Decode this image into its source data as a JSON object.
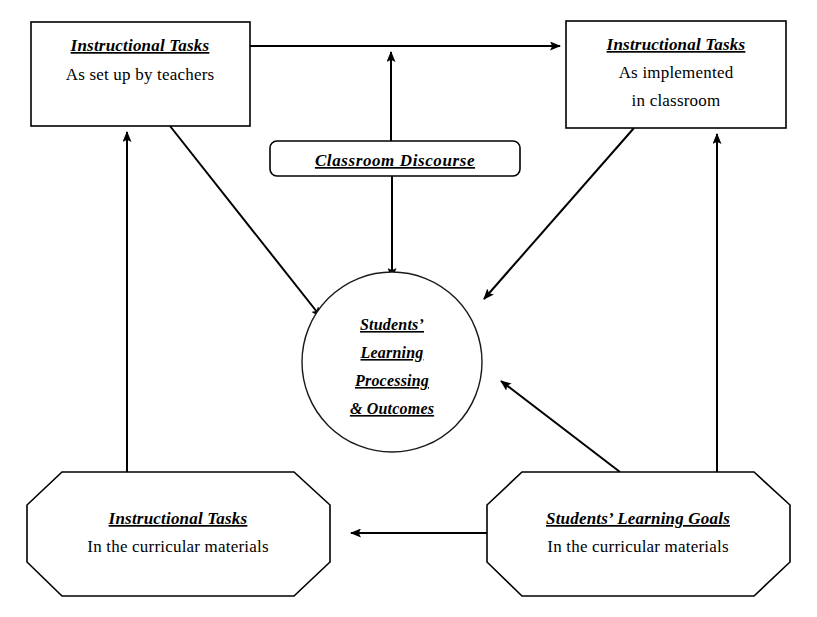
{
  "diagram": {
    "type": "flow-diagram",
    "background_color": "#ffffff",
    "line_color": "#000000",
    "nodes": {
      "tasks_set_up": {
        "shape": "rectangle",
        "title": "Instructional Tasks",
        "subtitle_line1": "As set up by teachers",
        "subtitle_line2": ""
      },
      "tasks_implemented": {
        "shape": "rectangle",
        "title": "Instructional Tasks",
        "subtitle_line1": "As implemented",
        "subtitle_line2": "in classroom"
      },
      "classroom_discourse": {
        "shape": "rounded-rectangle",
        "title": "Classroom Discourse"
      },
      "student_outcomes": {
        "shape": "circle",
        "line1": "Students’",
        "line2": "Learning",
        "line3": "Processing",
        "line4": "& Outcomes"
      },
      "tasks_curricular": {
        "shape": "octagon",
        "title": "Instructional Tasks",
        "subtitle_line1": "In the curricular materials"
      },
      "goals_curricular": {
        "shape": "octagon",
        "title": "Students’ Learning Goals",
        "subtitle_line1": "In the curricular materials"
      }
    },
    "edges": [
      {
        "id": "edge-setup-to-implemented",
        "from": "tasks_set_up",
        "to": "tasks_implemented",
        "style": "solid",
        "arrow": "single"
      },
      {
        "id": "edge-setup-to-outcomes",
        "from": "tasks_set_up",
        "to": "student_outcomes",
        "style": "solid",
        "arrow": "single"
      },
      {
        "id": "edge-discourse-to-top-link",
        "from": "classroom_discourse",
        "to": "edge-setup-to-implemented",
        "style": "solid",
        "arrow": "single"
      },
      {
        "id": "edge-discourse-to-outcomes",
        "from": "classroom_discourse",
        "to": "student_outcomes",
        "style": "solid",
        "arrow": "single"
      },
      {
        "id": "edge-implemented-to-outcomes",
        "from": "tasks_implemented",
        "to": "student_outcomes",
        "style": "solid",
        "arrow": "single"
      },
      {
        "id": "edge-curricular-to-setup",
        "from": "tasks_curricular",
        "to": "tasks_set_up",
        "style": "solid",
        "arrow": "single"
      },
      {
        "id": "edge-goals-to-implemented",
        "from": "goals_curricular",
        "to": "tasks_implemented",
        "style": "solid",
        "arrow": "single"
      },
      {
        "id": "edge-goals-to-outcomes",
        "from": "goals_curricular",
        "to": "student_outcomes",
        "style": "solid",
        "arrow": "single"
      },
      {
        "id": "edge-goals-to-curricular",
        "from": "goals_curricular",
        "to": "tasks_curricular",
        "style": "solid",
        "arrow": "single"
      }
    ]
  }
}
